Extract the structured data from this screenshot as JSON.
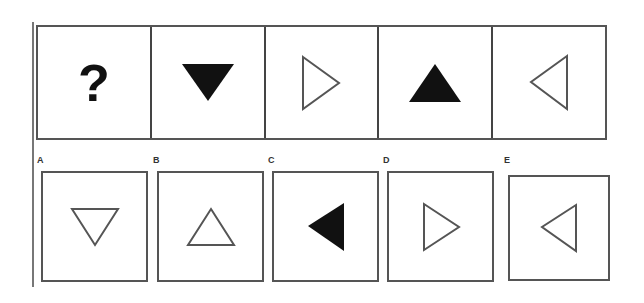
{
  "puzzle": {
    "sequence": [
      {
        "content": "?",
        "shape": "question-mark"
      },
      {
        "shape": "triangle",
        "direction": "down",
        "fill": "black"
      },
      {
        "shape": "triangle",
        "direction": "right",
        "fill": "outline"
      },
      {
        "shape": "triangle",
        "direction": "up",
        "fill": "black"
      },
      {
        "shape": "triangle",
        "direction": "left",
        "fill": "outline"
      }
    ],
    "options": [
      {
        "label": "A",
        "shape": "triangle",
        "direction": "down",
        "fill": "outline"
      },
      {
        "label": "B",
        "shape": "triangle",
        "direction": "up",
        "fill": "outline"
      },
      {
        "label": "C",
        "shape": "triangle",
        "direction": "left",
        "fill": "black"
      },
      {
        "label": "D",
        "shape": "triangle",
        "direction": "right",
        "fill": "outline"
      },
      {
        "label": "E",
        "shape": "triangle",
        "direction": "left",
        "fill": "outline"
      }
    ]
  },
  "colors": {
    "stroke": "#555555",
    "fill": "#111111",
    "background": "#ffffff"
  }
}
